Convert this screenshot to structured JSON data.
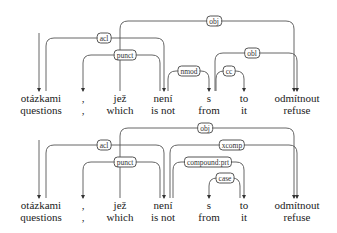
{
  "parses": [
    {
      "id": "parse-1",
      "offset_y": 0,
      "tokens": [
        {
          "cz": "otázkami",
          "en": "questions",
          "x": 41
        },
        {
          "cz": ",",
          "en": ",",
          "x": 83
        },
        {
          "cz": "jež",
          "en": "which",
          "x": 120
        },
        {
          "cz": "není",
          "en": "is not",
          "x": 163
        },
        {
          "cz": "s",
          "en": "from",
          "x": 209
        },
        {
          "cz": "to",
          "en": "it",
          "x": 244
        },
        {
          "cz": "odmítnout",
          "en": "refuse",
          "x": 297
        }
      ],
      "arcs": [
        {
          "label": "obj",
          "from_x": 120,
          "to_x": 294,
          "y": 21,
          "label_x": 214
        },
        {
          "label": "acl",
          "from_x": 46,
          "to_x": 164,
          "y": 38,
          "label_x": 104
        },
        {
          "label": "punct",
          "from_x": 160,
          "to_x": 83,
          "y": 55,
          "label_x": 125
        },
        {
          "label": "obl",
          "from_x": 215,
          "to_x": 297,
          "y": 53,
          "label_x": 252
        },
        {
          "label": "nmod",
          "from_x": 168,
          "to_x": 209,
          "y": 71,
          "label_x": 189
        },
        {
          "label": "cc",
          "from_x": 216,
          "to_x": 244,
          "y": 71,
          "label_x": 229
        }
      ]
    },
    {
      "id": "parse-2",
      "offset_y": 107,
      "tokens": [
        {
          "cz": "otázkami",
          "en": "questions",
          "x": 41
        },
        {
          "cz": ",",
          "en": ",",
          "x": 83
        },
        {
          "cz": "jež",
          "en": "which",
          "x": 120
        },
        {
          "cz": "není",
          "en": "is not",
          "x": 163
        },
        {
          "cz": "s",
          "en": "from",
          "x": 209
        },
        {
          "cz": "to",
          "en": "it",
          "x": 244
        },
        {
          "cz": "odmítnout",
          "en": "refuse",
          "x": 297
        }
      ],
      "arcs": [
        {
          "label": "obj",
          "from_x": 120,
          "to_x": 294,
          "y": 21,
          "label_x": 205
        },
        {
          "label": "acl",
          "from_x": 46,
          "to_x": 164,
          "y": 38,
          "label_x": 104
        },
        {
          "label": "punct",
          "from_x": 160,
          "to_x": 83,
          "y": 55,
          "label_x": 125
        },
        {
          "label": "xcomp",
          "from_x": 170,
          "to_x": 297,
          "y": 38,
          "label_x": 232
        },
        {
          "label": "compound:prt",
          "from_x": 173,
          "to_x": 244,
          "y": 55,
          "label_x": 208
        },
        {
          "label": "case",
          "from_x": 240,
          "to_x": 209,
          "y": 71,
          "label_x": 225
        }
      ]
    }
  ],
  "colors": {
    "line": "#555555",
    "text": "#222222",
    "background": "#ffffff"
  }
}
